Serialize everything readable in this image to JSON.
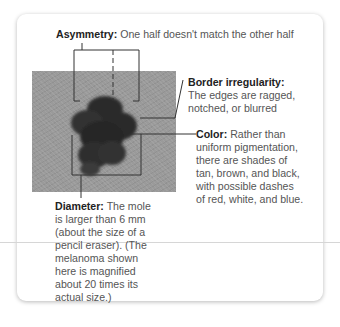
{
  "asymmetry": {
    "title": "Asymmetry:",
    "text": " One half doesn't match the other half"
  },
  "border": {
    "title": "Border irregularity:",
    "lines": [
      "The edges are ragged,",
      "notched, or blurred"
    ]
  },
  "color": {
    "title": "Color:",
    "lines": [
      " Rather than",
      "uniform pigmentation,",
      "there are shades of",
      "tan, brown, and black,",
      "with possible dashes",
      "of red, white, and blue."
    ]
  },
  "diameter": {
    "title": "Diameter:",
    "lines": [
      " The mole",
      "is larger than 6 mm",
      "(about the size of a",
      "pencil eraser). (The",
      "melanoma shown",
      "here is magnified",
      "about 20 times its",
      "actual size.)"
    ]
  },
  "image": {
    "subject": "melanoma-photo"
  }
}
